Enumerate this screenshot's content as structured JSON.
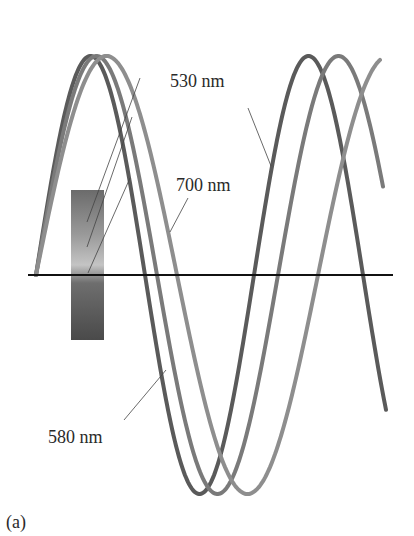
{
  "figure": {
    "panel_label": "(a)",
    "axis": {
      "x1": 28,
      "x2": 393,
      "y": 275,
      "color": "#111111"
    },
    "waves": [
      {
        "id": "530",
        "label": "530 nm",
        "color": "#5a5a5a",
        "x0": 36,
        "half_wavelength": 109,
        "amplitude": 219,
        "x_end": 386
      },
      {
        "id": "580",
        "label": "580 nm",
        "color": "#7a7a7a",
        "x0": 36,
        "half_wavelength": 121,
        "amplitude": 219,
        "x_end": 383
      },
      {
        "id": "700",
        "label": "700 nm",
        "color": "#8e8e8e",
        "x0": 36,
        "half_wavelength": 141,
        "amplitude": 219,
        "x_end": 380
      }
    ],
    "labels": [
      {
        "text": "530 nm",
        "x": 170,
        "y": 72
      },
      {
        "text": "700 nm",
        "x": 176,
        "y": 176
      },
      {
        "text": "580 nm",
        "x": 48,
        "y": 428
      }
    ],
    "gradient_bar": {
      "x": 71,
      "y": 190,
      "width": 33,
      "height": 150,
      "colors": [
        "#6b6b6b",
        "#9a9a9a",
        "#c4c4c4",
        "#5e5e5e",
        "#4a4a4a"
      ]
    }
  }
}
